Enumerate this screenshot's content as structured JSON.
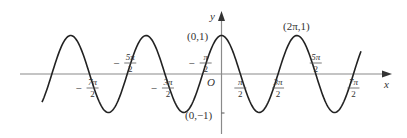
{
  "figure": {
    "function": "y = cos x",
    "axes": {
      "x_label": "x",
      "y_label": "y",
      "origin_label": "O"
    },
    "point_labels": {
      "max_at_origin": "(0,1)",
      "min_on_y_axis": "(0,−1)",
      "max_at_two_pi": "(2π,1)"
    },
    "tick_labels": [
      {
        "id": "m7pi2",
        "sign": "−",
        "num": "7π",
        "den": "2",
        "position": "below"
      },
      {
        "id": "m5pi2",
        "sign": "−",
        "num": "5π",
        "den": "2",
        "position": "above"
      },
      {
        "id": "m3pi2",
        "sign": "−",
        "num": "3π",
        "den": "2",
        "position": "below"
      },
      {
        "id": "mpi2",
        "sign": "−",
        "num": "π",
        "den": "2",
        "position": "above"
      },
      {
        "id": "pi2",
        "sign": "",
        "num": "π",
        "den": "2",
        "position": "below"
      },
      {
        "id": "3pi2",
        "sign": "",
        "num": "3π",
        "den": "2",
        "position": "below"
      },
      {
        "id": "5pi2",
        "sign": "",
        "num": "5π",
        "den": "2",
        "position": "above"
      },
      {
        "id": "7pi2",
        "sign": "",
        "num": "7π",
        "den": "2",
        "position": "below"
      }
    ],
    "colors": {
      "curve": "#222222",
      "axis": "#888888",
      "text": "#333333"
    }
  },
  "chart_data": {
    "type": "line",
    "title": "",
    "xlabel": "x",
    "ylabel": "y",
    "series": [
      {
        "name": "y = cos x",
        "x_range": [
          "-4.5π (approx)",
          "3.6π (approx)"
        ]
      }
    ],
    "key_points": [
      {
        "x": "0",
        "y": 1,
        "label": "(0,1)"
      },
      {
        "x": "2π",
        "y": 1,
        "label": "(2π,1)"
      },
      {
        "x": "0",
        "y": -1,
        "label": "(0,−1)"
      }
    ],
    "x_ticks": [
      "−7π/2",
      "−5π/2",
      "−3π/2",
      "−π/2",
      "π/2",
      "3π/2",
      "5π/2",
      "7π/2"
    ],
    "ylim": [
      -1,
      1
    ],
    "grid": false,
    "legend": "none"
  }
}
